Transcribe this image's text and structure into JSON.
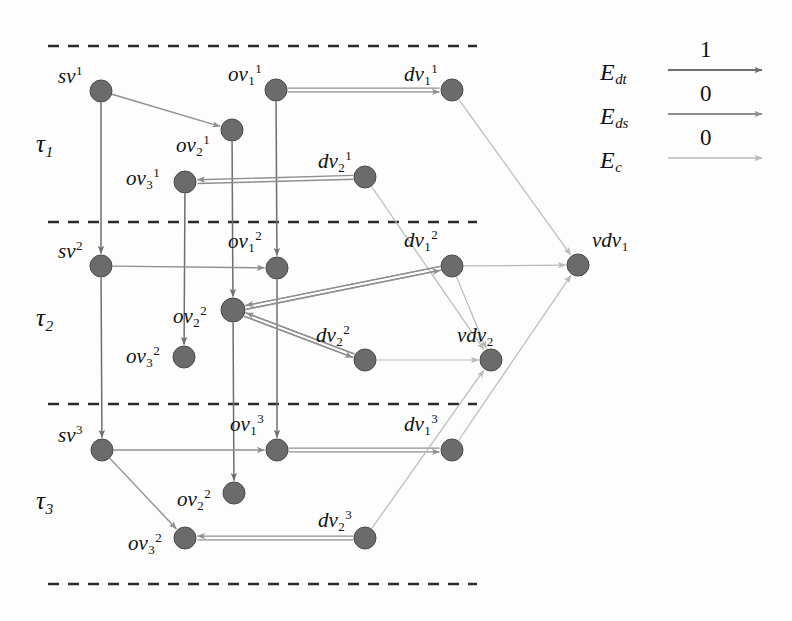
{
  "figure": {
    "background": "#fdfdfd",
    "width": 792,
    "height": 621
  },
  "colors": {
    "node_fill": "#6b6b6b",
    "node_stroke": "#4a4a4a",
    "edge_dt": "#6e6e6e",
    "edge_ds": "#8f8f8f",
    "edge_c": "#b9b9b9",
    "dashed": "#2b2b2b",
    "text": "#111111"
  },
  "timeslices": [
    {
      "name": "tau-1",
      "label": "τ",
      "sub": "1",
      "x": 36,
      "y": 131
    },
    {
      "name": "tau-2",
      "label": "τ",
      "sub": "2",
      "x": 36,
      "y": 305
    },
    {
      "name": "tau-3",
      "label": "τ",
      "sub": "3",
      "x": 36,
      "y": 488
    }
  ],
  "dashed_lines": [
    {
      "name": "divider-top",
      "x1": 48,
      "x2": 477,
      "y": 46
    },
    {
      "name": "divider-1-2",
      "x1": 48,
      "x2": 477,
      "y": 222
    },
    {
      "name": "divider-2-3",
      "x1": 48,
      "x2": 477,
      "y": 404
    },
    {
      "name": "divider-bottom",
      "x1": 48,
      "x2": 477,
      "y": 584
    }
  ],
  "nodes": [
    {
      "id": "sv1",
      "base": "sv",
      "sup": "1",
      "sub": "",
      "cx": 101,
      "cy": 91,
      "r": 11,
      "lx": 58,
      "ly": 64
    },
    {
      "id": "ov11",
      "base": "ov",
      "sup": "1",
      "sub": "1",
      "cx": 276,
      "cy": 90,
      "r": 11,
      "lx": 228,
      "ly": 62
    },
    {
      "id": "dv11",
      "base": "dv",
      "sup": "1",
      "sub": "1",
      "cx": 452,
      "cy": 90,
      "r": 11,
      "lx": 404,
      "ly": 62
    },
    {
      "id": "ov21",
      "base": "ov",
      "sup": "1",
      "sub": "2",
      "cx": 232,
      "cy": 130,
      "r": 11,
      "lx": 176,
      "ly": 133
    },
    {
      "id": "dv21",
      "base": "dv",
      "sup": "1",
      "sub": "2",
      "cx": 365,
      "cy": 177,
      "r": 11,
      "lx": 318,
      "ly": 149
    },
    {
      "id": "ov31",
      "base": "ov",
      "sup": "1",
      "sub": "3",
      "cx": 185,
      "cy": 182,
      "r": 11,
      "lx": 126,
      "ly": 166
    },
    {
      "id": "sv2",
      "base": "sv",
      "sup": "2",
      "sub": "",
      "cx": 101,
      "cy": 266,
      "r": 11,
      "lx": 58,
      "ly": 239
    },
    {
      "id": "ov12",
      "base": "ov",
      "sup": "2",
      "sub": "1",
      "cx": 277,
      "cy": 268,
      "r": 11,
      "lx": 228,
      "ly": 229
    },
    {
      "id": "dv12",
      "base": "dv",
      "sup": "2",
      "sub": "1",
      "cx": 452,
      "cy": 266,
      "r": 11,
      "lx": 404,
      "ly": 228
    },
    {
      "id": "ov22",
      "base": "ov",
      "sup": "2",
      "sub": "2",
      "cx": 233,
      "cy": 310,
      "r": 12,
      "lx": 173,
      "ly": 304
    },
    {
      "id": "dv22",
      "base": "dv",
      "sup": "2",
      "sub": "2",
      "cx": 365,
      "cy": 360,
      "r": 11,
      "lx": 316,
      "ly": 323
    },
    {
      "id": "ov32",
      "base": "ov",
      "sup": "2",
      "sub": "3",
      "cx": 184,
      "cy": 357,
      "r": 11,
      "lx": 126,
      "ly": 344
    },
    {
      "id": "sv3",
      "base": "sv",
      "sup": "3",
      "sub": "",
      "cx": 102,
      "cy": 450,
      "r": 11,
      "lx": 58,
      "ly": 423
    },
    {
      "id": "ov13",
      "base": "ov",
      "sup": "3",
      "sub": "1",
      "cx": 277,
      "cy": 450,
      "r": 11,
      "lx": 230,
      "ly": 412
    },
    {
      "id": "dv13",
      "base": "dv",
      "sup": "3",
      "sub": "1",
      "cx": 452,
      "cy": 450,
      "r": 11,
      "lx": 404,
      "ly": 412
    },
    {
      "id": "ov23",
      "base": "ov",
      "sup": "2",
      "sub": "2",
      "cx": 234,
      "cy": 493,
      "r": 11,
      "lx": 177,
      "ly": 487
    },
    {
      "id": "dv23",
      "base": "dv",
      "sup": "3",
      "sub": "2",
      "cx": 365,
      "cy": 538,
      "r": 11,
      "lx": 318,
      "ly": 508
    },
    {
      "id": "ov33",
      "base": "ov",
      "sup": "2",
      "sub": "3",
      "cx": 185,
      "cy": 538,
      "r": 11,
      "lx": 128,
      "ly": 531
    },
    {
      "id": "vdv1",
      "base": "vdv",
      "sup": "",
      "sub": "1",
      "cx": 578,
      "cy": 265,
      "r": 11,
      "lx": 592,
      "ly": 230
    },
    {
      "id": "vdv2",
      "base": "vdv",
      "sup": "",
      "sub": "2",
      "cx": 491,
      "cy": 360,
      "r": 11,
      "lx": 457,
      "ly": 325
    }
  ],
  "edges": [
    {
      "name": "sv1-ov21",
      "from": "sv1",
      "to": "ov21",
      "type": "ds",
      "arrow": true
    },
    {
      "name": "sv1-sv2",
      "from": "sv1",
      "to": "sv2",
      "type": "dt",
      "arrow": true
    },
    {
      "name": "ov11-ov12",
      "from": "ov11",
      "to": "ov12",
      "type": "dt",
      "arrow": true
    },
    {
      "name": "ov21-ov22",
      "from": "ov21",
      "to": "ov22",
      "type": "dt",
      "arrow": true
    },
    {
      "name": "ov31-ov32",
      "from": "ov31",
      "to": "ov32",
      "type": "dt",
      "arrow": true
    },
    {
      "name": "ov11-dv11",
      "from": "ov11",
      "to": "dv11",
      "type": "ds",
      "arrow": true,
      "double": true
    },
    {
      "name": "dv21-ov31",
      "from": "dv21",
      "to": "ov31",
      "type": "ds",
      "arrow": true,
      "double": true
    },
    {
      "name": "dv11-vdv1",
      "from": "dv11",
      "to": "vdv1",
      "type": "c",
      "arrow": true
    },
    {
      "name": "dv21-vdv2",
      "from": "dv21",
      "to": "vdv2",
      "type": "c",
      "arrow": true
    },
    {
      "name": "sv2-ov12",
      "from": "sv2",
      "to": "ov12",
      "type": "ds",
      "arrow": true
    },
    {
      "name": "sv2-sv3",
      "from": "sv2",
      "to": "sv3",
      "type": "dt",
      "arrow": true
    },
    {
      "name": "ov12-ov13",
      "from": "ov12",
      "to": "ov13",
      "type": "dt",
      "arrow": true
    },
    {
      "name": "ov22-ov23",
      "from": "ov22",
      "to": "ov23",
      "type": "dt",
      "arrow": true
    },
    {
      "name": "dv12-ov22",
      "from": "dv12",
      "to": "ov22",
      "type": "ds",
      "arrow": true,
      "double": true
    },
    {
      "name": "dv22-ov22",
      "from": "dv22",
      "to": "ov22",
      "type": "ds",
      "arrow": true,
      "double": true
    },
    {
      "name": "ov22-dv12",
      "from": "ov22",
      "to": "dv12",
      "type": "ds",
      "arrow": true,
      "double": true
    },
    {
      "name": "ov22-dv22",
      "from": "ov22",
      "to": "dv22",
      "type": "ds",
      "arrow": true,
      "double": true
    },
    {
      "name": "dv12-vdv1",
      "from": "dv12",
      "to": "vdv1",
      "type": "c",
      "arrow": true
    },
    {
      "name": "dv12-vdv2",
      "from": "dv12",
      "to": "vdv2",
      "type": "c",
      "arrow": true
    },
    {
      "name": "dv22-vdv2",
      "from": "dv22",
      "to": "vdv2",
      "type": "c",
      "arrow": true
    },
    {
      "name": "sv3-ov13",
      "from": "sv3",
      "to": "ov13",
      "type": "ds",
      "arrow": true
    },
    {
      "name": "sv3-ov33",
      "from": "sv3",
      "to": "ov33",
      "type": "ds",
      "arrow": true
    },
    {
      "name": "ov13-dv13",
      "from": "ov13",
      "to": "dv13",
      "type": "ds",
      "arrow": true,
      "double": true
    },
    {
      "name": "dv23-ov33",
      "from": "dv23",
      "to": "ov33",
      "type": "ds",
      "arrow": true,
      "double": true
    },
    {
      "name": "dv13-vdv1",
      "from": "dv13",
      "to": "vdv1",
      "type": "c",
      "arrow": true
    },
    {
      "name": "dv23-vdv2",
      "from": "dv23",
      "to": "vdv2",
      "type": "c",
      "arrow": true
    }
  ],
  "legend": {
    "name": "edge-type-legend",
    "items": [
      {
        "id": "Edt",
        "base": "E",
        "sub": "dt",
        "weight": "1",
        "type": "dt",
        "x": 600,
        "y": 60
      },
      {
        "id": "Eds",
        "base": "E",
        "sub": "ds",
        "weight": "0",
        "type": "ds",
        "x": 600,
        "y": 104
      },
      {
        "id": "Ec",
        "base": "E",
        "sub": "c",
        "weight": "0",
        "type": "c",
        "x": 600,
        "y": 148
      }
    ],
    "line_x1": 668,
    "line_x2": 762
  }
}
